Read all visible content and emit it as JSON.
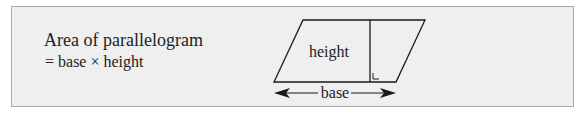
{
  "formula": {
    "line1": "Area of parallelogram",
    "line2": "= base × height"
  },
  "diagram": {
    "shape": "parallelogram",
    "height_label": "height",
    "base_label": "base",
    "right_angle_marker": true
  },
  "colors": {
    "background": "#efefef",
    "border": "#a8a8a8",
    "stroke": "#1a1a1a"
  }
}
